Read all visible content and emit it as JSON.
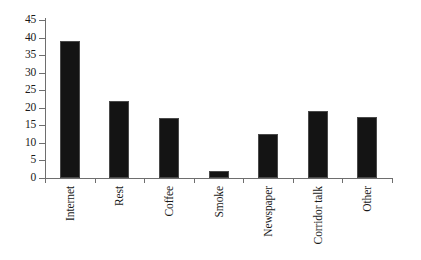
{
  "chart_data": {
    "type": "bar",
    "title": "",
    "xlabel": "",
    "ylabel": "",
    "categories": [
      "Internet",
      "Rest",
      "Coffee",
      "Smoke",
      "Newspaper",
      "Corridor talk",
      "Other"
    ],
    "values": [
      39,
      22,
      17,
      2,
      12.5,
      19,
      17.5
    ],
    "ylim": [
      0,
      45
    ],
    "ytick_labels": [
      "0",
      "5",
      "10",
      "15",
      "20",
      "25",
      "30",
      "35",
      "40",
      "45"
    ],
    "ytick_values": [
      0,
      5,
      10,
      15,
      20,
      25,
      30,
      35,
      40,
      45
    ],
    "grid": false,
    "legend": false,
    "bar_color": "#141414",
    "axis_color": "#6e6e6e",
    "background": "#ffffff"
  }
}
